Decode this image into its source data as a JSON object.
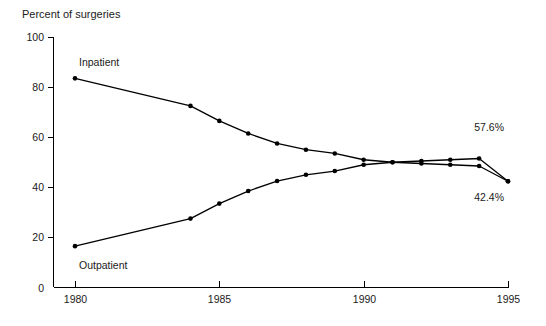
{
  "chart_data": {
    "type": "line",
    "title": "",
    "ylabel": "Percent of surgeries",
    "xlabel": "",
    "ylim": [
      0,
      100
    ],
    "xlim": [
      1980,
      1995
    ],
    "yticks": [
      0,
      20,
      40,
      60,
      80,
      100
    ],
    "xticks": [
      1980,
      1985,
      1990,
      1995
    ],
    "grid": false,
    "legend_position": "inline-annotations",
    "x": [
      1980,
      1984,
      1985,
      1986,
      1987,
      1988,
      1989,
      1990,
      1991,
      1992,
      1993,
      1994,
      1995
    ],
    "series": [
      {
        "name": "Inpatient",
        "end_value_label": "57.6%",
        "values": [
          83.5,
          72.5,
          66.5,
          61.5,
          57.5,
          55.0,
          53.5,
          51.0,
          50.0,
          49.5,
          49.0,
          48.5,
          42.4
        ]
      },
      {
        "name": "Outpatient",
        "end_value_label": "42.4%",
        "values": [
          16.5,
          27.5,
          33.5,
          38.5,
          42.5,
          45.0,
          46.5,
          49.0,
          50.0,
          50.5,
          51.0,
          51.5,
          57.6
        ]
      }
    ],
    "annotations": [
      {
        "text": "Inpatient",
        "x": 1980,
        "y": 90
      },
      {
        "text": "Outpatient",
        "x": 1980,
        "y": 9
      },
      {
        "text": "57.6%",
        "x": 1995,
        "y": 64
      },
      {
        "text": "42.4%",
        "x": 1995,
        "y": 36
      }
    ],
    "colors": {
      "line": "#000000",
      "marker": "#000000",
      "axis": "#000000",
      "text": "#1a1a1a",
      "background": "#ffffff"
    }
  }
}
